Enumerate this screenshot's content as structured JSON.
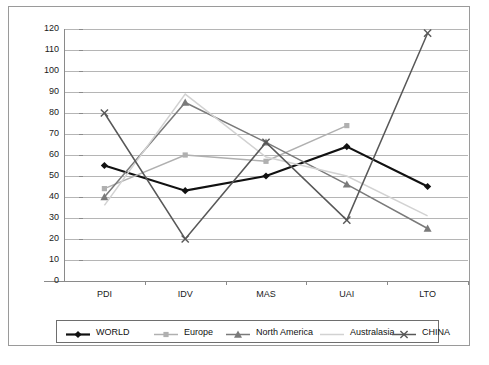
{
  "chart_data": {
    "type": "line",
    "title": "",
    "xlabel": "",
    "ylabel": "",
    "ylim": [
      0,
      120
    ],
    "ytick_step": 10,
    "grid": true,
    "legend_position": "bottom",
    "categories": [
      "PDI",
      "IDV",
      "MAS",
      "UAI",
      "LTO"
    ],
    "ytick_labels": [
      "120",
      "110",
      "100",
      "90",
      "80",
      "70",
      "60",
      "50",
      "40",
      "30",
      "20",
      "10",
      "0"
    ],
    "series": [
      {
        "name": "WORLD",
        "marker": "diamond",
        "color": "#111111",
        "values": [
          55,
          43,
          50,
          64,
          45
        ]
      },
      {
        "name": "Europe",
        "marker": "square",
        "color": "#b0b0b0",
        "values": [
          44,
          60,
          57,
          74,
          null
        ]
      },
      {
        "name": "North America",
        "marker": "triangle",
        "color": "#7a7a7a",
        "values": [
          40,
          85,
          66,
          46,
          25
        ]
      },
      {
        "name": "Australasia",
        "marker": "none",
        "color": "#d2d2d2",
        "values": [
          36,
          89,
          59,
          50,
          31
        ]
      },
      {
        "name": "CHINA",
        "marker": "cross",
        "color": "#585858",
        "values": [
          80,
          20,
          66,
          29,
          118
        ]
      }
    ]
  },
  "legend": {
    "entries": [
      {
        "label": "WORLD"
      },
      {
        "label": "Europe"
      },
      {
        "label": "North America"
      },
      {
        "label": "Australasia"
      },
      {
        "label": "CHINA"
      }
    ]
  }
}
